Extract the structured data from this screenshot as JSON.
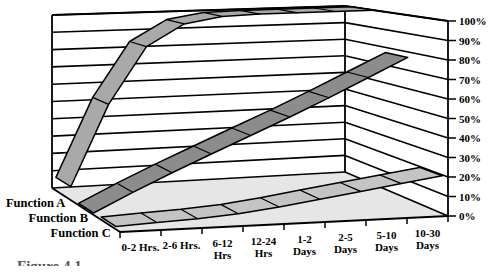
{
  "figure": {
    "caption": "Figure 4.1"
  },
  "colors": {
    "background": "#ffffff",
    "wall": "#ffffff",
    "floor": "#e6e6e6",
    "line": "#000000"
  },
  "chart_data": {
    "type": "line",
    "variant": "3d-ribbon",
    "title": "",
    "xlabel": "",
    "ylabel": "",
    "ylim": [
      0,
      100
    ],
    "grid": true,
    "legend_position": "left",
    "categories": [
      "0-2 Hrs.",
      "2-6 Hrs.",
      "6-12 Hrs",
      "12-24 Hrs",
      "1-2 Days",
      "2-5 Days",
      "5-10 Days",
      "10-30 Days"
    ],
    "category_label_lines": [
      [
        "0-2 Hrs."
      ],
      [
        "2-6 Hrs."
      ],
      [
        "6-12",
        "Hrs"
      ],
      [
        "12-24",
        "Hrs"
      ],
      [
        "1-2",
        "Days"
      ],
      [
        "2-5",
        "Days"
      ],
      [
        "5-10",
        "Days"
      ],
      [
        "10-30",
        "Days"
      ]
    ],
    "ytick_labels": [
      "0%",
      "10%",
      "20%",
      "30%",
      "40%",
      "50%",
      "60%",
      "70%",
      "80%",
      "90%",
      "100%"
    ],
    "series": [
      {
        "name": "Function A",
        "color": "#a9a9a9",
        "values": [
          30,
          75,
          93,
          99,
          100,
          100,
          100,
          100
        ]
      },
      {
        "name": "Function B",
        "color": "#8c8c8c",
        "values": [
          6,
          16,
          25,
          34,
          43,
          52,
          62,
          72
        ]
      },
      {
        "name": "Function C",
        "color": "#c4c4c4",
        "values": [
          2,
          3,
          4,
          6,
          9,
          12,
          15,
          18
        ]
      }
    ]
  }
}
